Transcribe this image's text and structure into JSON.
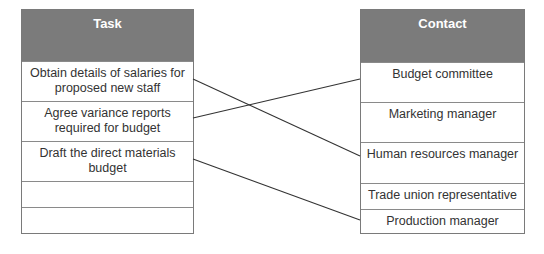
{
  "left_table": {
    "header": "Task",
    "rows": [
      "Obtain details of salaries for proposed new staff",
      "Agree variance reports required for budget",
      "Draft the direct materials budget",
      "",
      ""
    ]
  },
  "right_table": {
    "header": "Contact",
    "rows": [
      "Budget committee",
      "Marketing manager",
      "Human resources manager",
      "Trade union representative",
      "Production manager"
    ]
  },
  "connections": [
    {
      "from": "Obtain details of salaries for proposed new staff",
      "to": "Human resources manager"
    },
    {
      "from": "Agree variance reports required for budget",
      "to": "Budget committee"
    },
    {
      "from": "Draft the direct materials budget",
      "to": "Production manager"
    }
  ],
  "colors": {
    "header_bg": "#7b7b7b",
    "header_text": "#ffffff",
    "line": "#333333",
    "border": "#7a7a7a"
  }
}
